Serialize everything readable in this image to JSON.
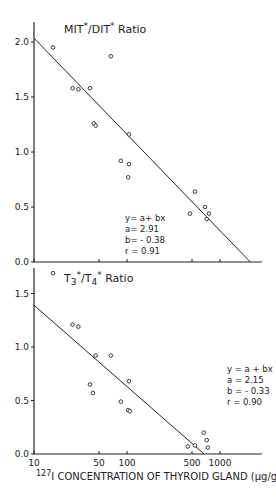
{
  "chart_data": [
    {
      "type": "scatter",
      "title": "MIT*/DIT* Ratio",
      "xlabel": "127I CONCENTRATION OF THYROID GLAND (µg/g)",
      "ylabel": "",
      "xscale": "log",
      "xlim": [
        10,
        2500
      ],
      "ylim": [
        0.0,
        2.1
      ],
      "yticks": [
        "2.0",
        "1.5",
        "1.0",
        "0.5",
        "0.0"
      ],
      "xticks": [
        "10",
        "50",
        "100",
        "500",
        "1000"
      ],
      "grid": false,
      "points": [
        [
          16,
          1.95
        ],
        [
          67,
          1.87
        ],
        [
          26,
          1.58
        ],
        [
          30,
          1.57
        ],
        [
          40,
          1.58
        ],
        [
          44,
          1.26
        ],
        [
          46,
          1.24
        ],
        [
          105,
          1.16
        ],
        [
          86,
          0.92
        ],
        [
          105,
          0.89
        ],
        [
          103,
          0.77
        ],
        [
          537,
          0.64
        ],
        [
          476,
          0.44
        ],
        [
          690,
          0.5
        ],
        [
          760,
          0.44
        ],
        [
          720,
          0.39
        ]
      ],
      "fit": {
        "equation": "y= a+ bx",
        "a": "a= 2.91",
        "b": "b= - 0.38",
        "r": "r = 0.91",
        "a_val": 2.91,
        "b_val": -0.38
      }
    },
    {
      "type": "scatter",
      "title": "T3*/T4* Ratio",
      "xlabel": "127I CONCENTRATION OF THYROID GLAND (µg/g)",
      "ylabel": "",
      "xscale": "log",
      "xlim": [
        10,
        2500
      ],
      "ylim": [
        0.0,
        1.8
      ],
      "yticks": [
        "1.5",
        "1.0",
        "0.5",
        "0.0"
      ],
      "xticks": [
        "10",
        "50",
        "100",
        "500",
        "1000"
      ],
      "grid": false,
      "points": [
        [
          16,
          1.69
        ],
        [
          26,
          1.21
        ],
        [
          30,
          1.19
        ],
        [
          46,
          0.92
        ],
        [
          67,
          0.92
        ],
        [
          40,
          0.65
        ],
        [
          43,
          0.57
        ],
        [
          105,
          0.68
        ],
        [
          86,
          0.49
        ],
        [
          103,
          0.41
        ],
        [
          107,
          0.4
        ],
        [
          450,
          0.07
        ],
        [
          537,
          0.08
        ],
        [
          670,
          0.2
        ],
        [
          720,
          0.13
        ],
        [
          740,
          0.06
        ]
      ],
      "fit": {
        "equation": "y = a + bx",
        "a": "a = 2.15",
        "b": "b = - 0.33",
        "r": "r = 0.90",
        "a_val": 2.15,
        "b_val": -0.33
      }
    }
  ],
  "labels": {
    "top_title_main": "MIT",
    "top_title_mid": "/DIT",
    "top_title_end": " Ratio",
    "bottom_title_a": "T",
    "bottom_title_b": "/T",
    "bottom_title_end": " Ratio",
    "star": "*",
    "sub3": "3",
    "sub4": "4",
    "xlabel_sup": "127",
    "xlabel_text": "I CONCENTRATION OF THYROID GLAND (µg/g)"
  }
}
